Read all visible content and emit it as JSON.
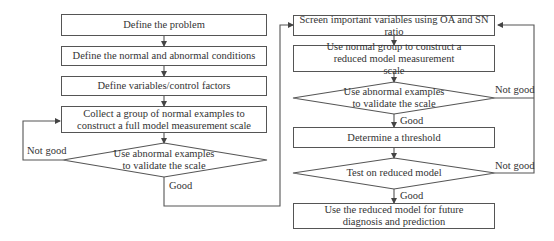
{
  "left_column": {
    "steps": [
      {
        "id": "define-problem",
        "text": "Define the problem"
      },
      {
        "id": "define-conditions",
        "text": "Define the normal and abnormal conditions"
      },
      {
        "id": "define-variables",
        "text": "Define variables/control factors"
      },
      {
        "id": "collect-normal",
        "text": "Collect a group of normal examples to construct a full model measurement scale"
      }
    ],
    "decision": {
      "text": "Use abnormal examples to validate the scale",
      "no_label": "Not good",
      "yes_label": "Good"
    }
  },
  "right_column": {
    "steps": [
      {
        "id": "screen-variables",
        "text": "Screen important variables using OA and SN ratio"
      },
      {
        "id": "reduced-scale",
        "text": "Use normal group to construct a reduced model measurement scale"
      },
      {
        "id": "threshold",
        "text": "Determine a threshold"
      },
      {
        "id": "use-reduced",
        "text": "Use the reduced model for future diagnosis and prediction"
      }
    ],
    "decision1": {
      "text": "Use abnormal examples to validate the scale",
      "no_label": "Not good",
      "yes_label": "Good"
    },
    "decision2": {
      "text": "Test on reduced model",
      "no_label": "Not good",
      "yes_label": "Good"
    }
  },
  "colors": {
    "stroke": "#555555",
    "text": "#333333",
    "background": "#ffffff"
  }
}
